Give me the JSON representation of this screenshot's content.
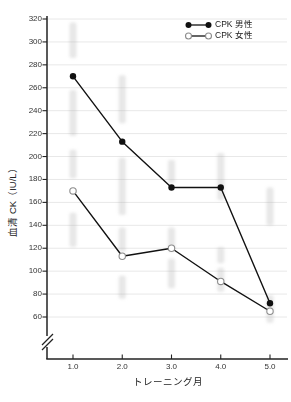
{
  "chart": {
    "background": "#ffffff"
  },
  "chart_data": {
    "type": "line",
    "title": "",
    "xlabel": "トレーニング月",
    "ylabel": "血清 CK（IU/L）",
    "x": [
      1.0,
      2.0,
      3.0,
      4.0,
      5.0
    ],
    "x_tick_labels": [
      "1.0",
      "2.0",
      "3.0",
      "4.0",
      "5.0"
    ],
    "y_ticks": [
      60,
      80,
      100,
      120,
      140,
      160,
      180,
      200,
      220,
      240,
      260,
      280,
      300,
      320
    ],
    "y_tick_labels": [
      "60",
      "80",
      "100",
      "120",
      "140",
      "160",
      "180",
      "200",
      "220",
      "240",
      "260",
      "280",
      "300",
      "320"
    ],
    "ylim": [
      60,
      320
    ],
    "y_axis_break": true,
    "grid": "horizontal",
    "legend_position": "top-right",
    "series": [
      {
        "name": "CPK 男性",
        "marker": "filled-circle",
        "color": "#111111",
        "values": [
          270,
          213,
          173,
          173,
          72
        ]
      },
      {
        "name": "CPK 女性",
        "marker": "open-circle",
        "color": "#111111",
        "marker_stroke": "#8c8c8c",
        "values": [
          170,
          113,
          120,
          91,
          65
        ]
      }
    ],
    "colors": {
      "line": "#111111",
      "axis": "#222222",
      "gridline": "#e8e8e8",
      "tick_text": "#333333",
      "ghost": "#aaaaaa"
    },
    "ghost_artifacts": [
      {
        "month": 1,
        "v_from": 286,
        "v_to": 317
      },
      {
        "month": 1,
        "v_from": 218,
        "v_to": 258
      },
      {
        "month": 1,
        "v_from": 181,
        "v_to": 206
      },
      {
        "month": 1,
        "v_from": 121,
        "v_to": 151
      },
      {
        "month": 2,
        "v_from": 229,
        "v_to": 271
      },
      {
        "month": 2,
        "v_from": 149,
        "v_to": 199
      },
      {
        "month": 2,
        "v_from": 117,
        "v_to": 138
      },
      {
        "month": 2,
        "v_from": 76,
        "v_to": 96
      },
      {
        "month": 3,
        "v_from": 177,
        "v_to": 197
      },
      {
        "month": 3,
        "v_from": 117,
        "v_to": 138
      },
      {
        "month": 3,
        "v_from": 85,
        "v_to": 111
      },
      {
        "month": 4,
        "v_from": 162,
        "v_to": 203
      },
      {
        "month": 4,
        "v_from": 107,
        "v_to": 121
      },
      {
        "month": 4,
        "v_from": 82,
        "v_to": 103
      },
      {
        "month": 5,
        "v_from": 140,
        "v_to": 173
      },
      {
        "month": 5,
        "v_from": 55,
        "v_to": 79
      }
    ]
  }
}
